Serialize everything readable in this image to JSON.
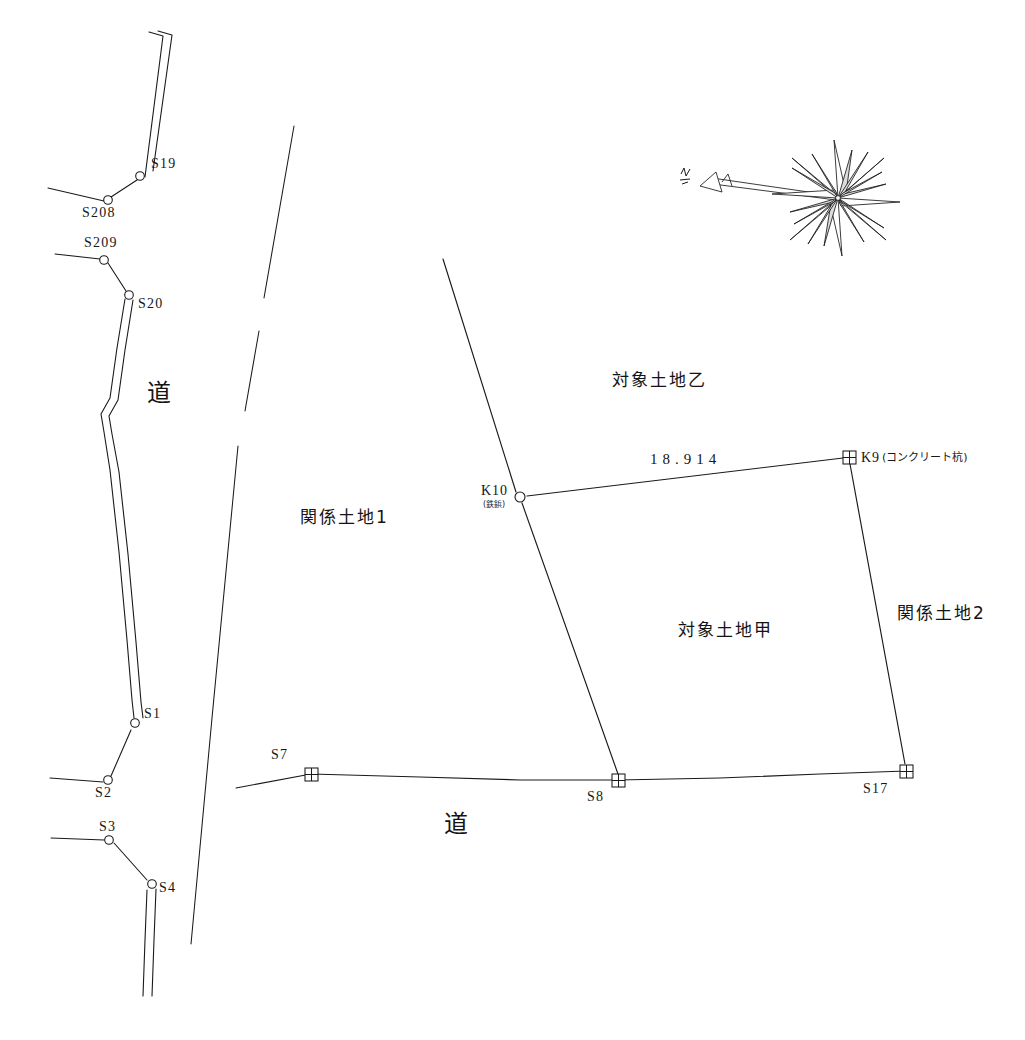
{
  "document": {
    "kind": "cadastral-survey-map",
    "background_color": "#ffffff",
    "line_color": "#1a1a1a"
  },
  "compass": {
    "name": "compass-rose",
    "center_x": 838,
    "center_y": 198,
    "pointer_label": "N"
  },
  "parcels": [
    {
      "id": "kankei-1",
      "label": "関係土地1",
      "x": 300,
      "y": 518
    },
    {
      "id": "taisho-otsu",
      "label": "対象土地乙",
      "x": 612,
      "y": 372
    },
    {
      "id": "taisho-kou",
      "label": "対象土地甲",
      "x": 678,
      "y": 622
    },
    {
      "id": "kankei-2",
      "label": "関係土地2",
      "x": 898,
      "y": 606
    }
  ],
  "road_labels": [
    {
      "id": "road-left",
      "label": "道",
      "x": 152,
      "y": 383
    },
    {
      "id": "road-bottom",
      "label": "道",
      "x": 447,
      "y": 814
    }
  ],
  "dimensions": [
    {
      "id": "k10-k9",
      "value": "18.914",
      "x": 651,
      "y": 455,
      "from": "K10",
      "to": "K9"
    }
  ],
  "boundary_points": [
    {
      "id": "K10",
      "label": "K10",
      "sublabel": "(鉄鋲)",
      "x": 520,
      "y": 497,
      "marker": "circle",
      "label_x": 480,
      "label_y": 488,
      "sub_x": 482,
      "sub_y": 504
    },
    {
      "id": "K9",
      "label": "K9",
      "paren": "(コンクリート杭)",
      "x": 849,
      "y": 457,
      "marker": "square-cross",
      "label_x": 861,
      "label_y": 452
    },
    {
      "id": "S7",
      "label": "S7",
      "x": 311,
      "y": 774,
      "marker": "square-cross",
      "label_x": 272,
      "label_y": 752
    },
    {
      "id": "S8",
      "label": "S8",
      "x": 618,
      "y": 780,
      "marker": "square-cross",
      "label_x": 588,
      "label_y": 793
    },
    {
      "id": "S17",
      "label": "S17",
      "x": 906,
      "y": 771,
      "marker": "square-cross",
      "label_x": 864,
      "label_y": 785
    }
  ],
  "road_points": [
    {
      "id": "S19",
      "label": "S19",
      "x": 140,
      "y": 176,
      "label_x": 151,
      "label_y": 164
    },
    {
      "id": "S208",
      "label": "S208",
      "x": 108,
      "y": 200,
      "label_x": 84,
      "label_y": 211
    },
    {
      "id": "S209",
      "label": "S209",
      "x": 104,
      "y": 260,
      "label_x": 85,
      "label_y": 240
    },
    {
      "id": "S20",
      "label": "S20",
      "x": 129,
      "y": 295,
      "label_x": 138,
      "label_y": 300
    },
    {
      "id": "S1",
      "label": "S1",
      "x": 134,
      "y": 723,
      "label_x": 144,
      "label_y": 712
    },
    {
      "id": "S2",
      "label": "S2",
      "x": 108,
      "y": 781,
      "label_x": 96,
      "label_y": 791
    },
    {
      "id": "S3",
      "label": "S3",
      "x": 109,
      "y": 840,
      "label_x": 100,
      "label_y": 824
    },
    {
      "id": "S4",
      "label": "S4",
      "x": 151,
      "y": 884,
      "label_x": 159,
      "label_y": 888
    }
  ],
  "geometry": {
    "road_west_edge": "M150,33 L164,37 L146,178 L121,202 L52,188",
    "road_east_edge": "M158,32 L172,36 L152,172 L112,196 L48,182",
    "road_mid_west": "M57,257 L105,262 L126,293 L112,410 L104,418 L108,470 L123,600 L132,718",
    "road_mid_east": "M57,251 L103,256 L133,291 L120,406 L112,416 L116,470 L131,598 L140,716",
    "road_lower_west": "M131,726 L116,760 L107,779 L52,776",
    "road_lower_east": "M139,724 L124,758 L112,786 L50,783",
    "road_s3_west": "M52,838 L106,839 L148,880 L143,995",
    "road_s3_east": "M52,844 L104,845 L155,886 L152,996",
    "mid_boundary_segments": [
      "M294,126 L265,297",
      "M259,330 L245,412",
      "M238,444 L190,944"
    ],
    "parcel_k10_top": "M443,259 L520,497",
    "parcel_k10_s8": "M520,497 L618,780",
    "parcel_k10_k9": "M520,497 L849,457",
    "parcel_k9_s17": "M849,457 L906,771",
    "road_bottom_line": "M237,787 L311,774 L470,780 L618,780 L760,777 L906,771"
  }
}
